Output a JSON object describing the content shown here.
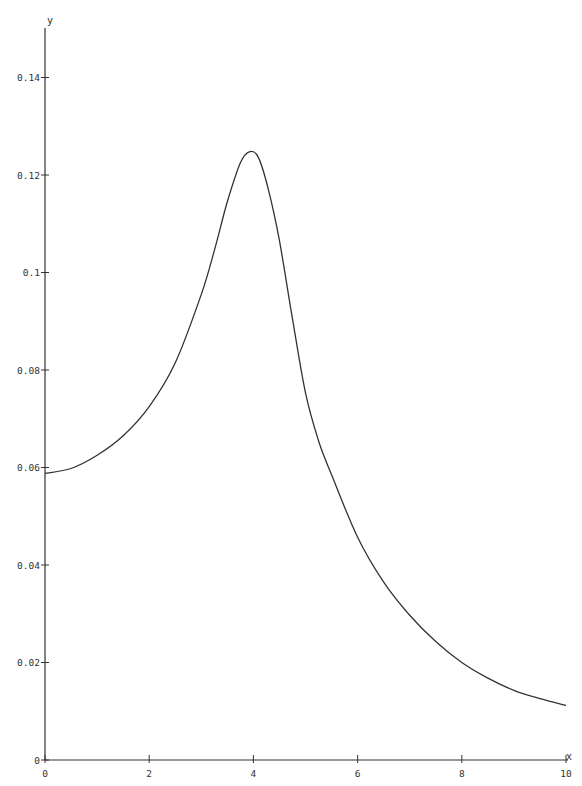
{
  "chart_data": {
    "type": "line",
    "title": "",
    "xlabel": "x",
    "ylabel": "y",
    "xlim": [
      0,
      10
    ],
    "ylim": [
      0,
      0.15
    ],
    "grid": false,
    "legend": null,
    "x_ticks": [
      0,
      2,
      4,
      6,
      8,
      10
    ],
    "x_tick_labels": [
      "0",
      "2",
      "4",
      "6",
      "8",
      "10"
    ],
    "y_ticks": [
      0,
      0.02,
      0.04,
      0.06,
      0.08,
      0.1,
      0.12,
      0.14
    ],
    "y_tick_labels": [
      "0",
      "0.02",
      "0.04",
      "0.06",
      "0.08",
      "0.1",
      "0.12",
      "0.14"
    ],
    "series": [
      {
        "name": "y",
        "color": "#333333",
        "x": [
          0,
          0.5,
          1,
          1.5,
          2,
          2.5,
          3,
          3.25,
          3.5,
          3.75,
          3.93,
          4.1,
          4.3,
          4.5,
          4.75,
          5,
          5.25,
          5.5,
          6,
          6.5,
          7,
          7.5,
          8,
          8.5,
          9,
          9.5,
          10
        ],
        "y": [
          0.0588,
          0.0598,
          0.0625,
          0.0665,
          0.0725,
          0.0815,
          0.0955,
          0.1045,
          0.1145,
          0.1225,
          0.1248,
          0.1235,
          0.1165,
          0.1065,
          0.0905,
          0.0753,
          0.0655,
          0.0585,
          0.0457,
          0.0365,
          0.0297,
          0.0243,
          0.02,
          0.0168,
          0.0143,
          0.0126,
          0.0112
        ]
      }
    ]
  }
}
